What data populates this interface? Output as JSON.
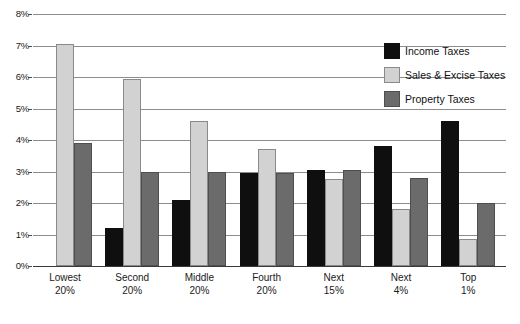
{
  "chart_data": {
    "type": "bar",
    "title": "",
    "subtitle": "",
    "xlabel": "",
    "ylabel": "",
    "ylim": [
      0,
      8
    ],
    "ytick_values": [
      0,
      1,
      2,
      3,
      4,
      5,
      6,
      7,
      8
    ],
    "ytick_labels": [
      "0%",
      "1%",
      "2%",
      "3%",
      "4%",
      "5%",
      "6%",
      "7%",
      "8%"
    ],
    "grid": true,
    "legend_position": "top-right",
    "categories": [
      {
        "line1": "Lowest",
        "line2": "20%"
      },
      {
        "line1": "Second",
        "line2": "20%"
      },
      {
        "line1": "Middle",
        "line2": "20%"
      },
      {
        "line1": "Fourth",
        "line2": "20%"
      },
      {
        "line1": "Next",
        "line2": "15%"
      },
      {
        "line1": "Next",
        "line2": "4%"
      },
      {
        "line1": "Top",
        "line2": "1%"
      }
    ],
    "series": [
      {
        "name": "Income Taxes",
        "color": "#0f0f0f",
        "values": [
          0,
          1.2,
          2.1,
          2.95,
          3.05,
          3.8,
          4.6
        ]
      },
      {
        "name": "Sales & Excise Taxes",
        "color": "#d2d2d2",
        "values": [
          7.05,
          5.95,
          4.6,
          3.7,
          2.75,
          1.8,
          0.85
        ]
      },
      {
        "name": "Property Taxes",
        "color": "#6b6b6b",
        "values": [
          3.9,
          3.0,
          3.0,
          2.95,
          3.05,
          2.8,
          2.0
        ]
      }
    ]
  },
  "legend": {
    "items": [
      {
        "label": "Income Taxes",
        "swatch": "income"
      },
      {
        "label": "Sales & Excise Taxes",
        "swatch": "sales"
      },
      {
        "label": "Property Taxes",
        "swatch": "property"
      }
    ]
  }
}
